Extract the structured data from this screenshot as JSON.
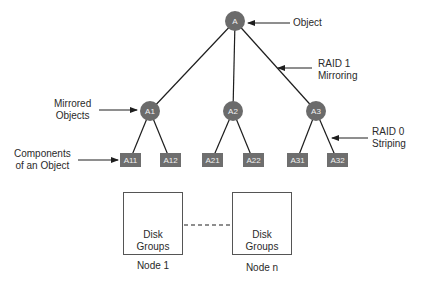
{
  "tree": {
    "root": {
      "label": "A"
    },
    "mirrors": [
      {
        "label": "A1",
        "components": [
          {
            "label": "A11"
          },
          {
            "label": "A12"
          }
        ]
      },
      {
        "label": "A2",
        "components": [
          {
            "label": "A21"
          },
          {
            "label": "A22"
          }
        ]
      },
      {
        "label": "A3",
        "components": [
          {
            "label": "A31"
          },
          {
            "label": "A32"
          }
        ]
      }
    ]
  },
  "annotations": {
    "object": "Object",
    "raid1_line1": "RAID 1",
    "raid1_line2": "Mirroring",
    "mirrored_line1": "Mirrored",
    "mirrored_line2": "Objects",
    "components_line1": "Components",
    "components_line2": "of an Object",
    "raid0_line1": "RAID 0",
    "raid0_line2": "Striping"
  },
  "hosts": [
    {
      "disk_line1": "Disk",
      "disk_line2": "Groups",
      "label": "Node 1"
    },
    {
      "disk_line1": "Disk",
      "disk_line2": "Groups",
      "label": "Node n"
    }
  ],
  "colors": {
    "node_fill": "#6b6b6b",
    "line": "#1e1e1e",
    "disk_fill": "#8c8c8c"
  }
}
